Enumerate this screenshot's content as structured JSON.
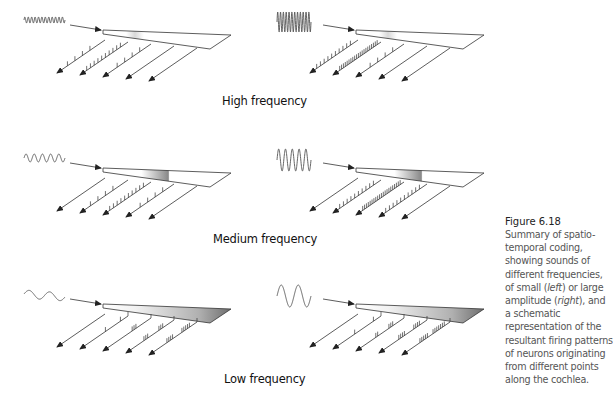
{
  "figure": {
    "number": "Figure 6.18",
    "caption_parts": [
      {
        "text": "Summary of spatio-temporal coding, showing sounds of different frequencies, of small (",
        "italic": false
      },
      {
        "text": "left",
        "italic": true
      },
      {
        "text": ") or large amplitude (",
        "italic": false
      },
      {
        "text": "right",
        "italic": true
      },
      {
        "text": "), and a schematic representation of the resultant firing patterns of neurons originating from different points along the cochlea.",
        "italic": false
      }
    ]
  },
  "rows": [
    {
      "label": "High frequency",
      "label_pos": {
        "x": 222,
        "y": 94
      },
      "y_offset": 0,
      "wave_cycles": 12,
      "shade_start": 0.18,
      "shade_end": 0.32,
      "panels": [
        {
          "side": "left",
          "amplitude": "small",
          "x_offset": 0,
          "amp": 3,
          "spikes": [
            [
              3,
              5,
              7,
              9
            ],
            [
              1,
              2,
              3,
              4,
              5,
              6,
              7,
              8,
              9,
              10
            ],
            [
              2,
              4,
              6,
              8
            ],
            [],
            []
          ]
        },
        {
          "side": "right",
          "amplitude": "large",
          "x_offset": 253,
          "amp": 10,
          "spikes": [
            [
              1,
              2,
              3,
              4,
              5,
              6,
              7,
              8,
              9,
              10
            ],
            [
              0,
              0.5,
              1,
              1.5,
              2,
              2.5,
              3,
              3.5,
              4,
              4.5,
              5,
              5.5,
              6,
              6.5,
              7,
              7.5,
              8,
              8.5,
              9,
              9.5,
              10
            ],
            [
              2,
              4,
              6,
              8
            ],
            [],
            []
          ]
        }
      ]
    },
    {
      "label": "Medium frequency",
      "label_pos": {
        "x": 213,
        "y": 232
      },
      "y_offset": 138,
      "wave_cycles": 5,
      "shade_start": 0.3,
      "shade_end": 0.52,
      "panels": [
        {
          "side": "left",
          "amplitude": "small",
          "x_offset": 0,
          "amp": 4,
          "spikes": [
            [],
            [
              3,
              5,
              7,
              9
            ],
            [
              1,
              2,
              3,
              4,
              5,
              6,
              7,
              8,
              9,
              10
            ],
            [
              2,
              4,
              6,
              8
            ],
            []
          ]
        },
        {
          "side": "right",
          "amplitude": "large",
          "x_offset": 253,
          "amp": 11,
          "spikes": [
            [],
            [
              1,
              2,
              3,
              4,
              5,
              6,
              7,
              8,
              9,
              10
            ],
            [
              0,
              0.5,
              1,
              1.5,
              2,
              2.5,
              3,
              3.5,
              4,
              4.5,
              5,
              5.5,
              6,
              6.5,
              7,
              7.5,
              8,
              8.5,
              9,
              9.5,
              10
            ],
            [
              1,
              2,
              3,
              4,
              5,
              6,
              7,
              8,
              9,
              10
            ],
            []
          ]
        }
      ]
    },
    {
      "label": "Low frequency",
      "label_pos": {
        "x": 224,
        "y": 372
      },
      "y_offset": 274,
      "wave_cycles": 2,
      "shade_start": 0.25,
      "shade_end": 1.0,
      "panels": [
        {
          "side": "left",
          "amplitude": "small",
          "x_offset": 0,
          "amp": 4,
          "spikes": [
            [],
            [
              1,
              5
            ],
            [
              3,
              3.5,
              4
            ],
            [
              2,
              2.5,
              3,
              6,
              6.5,
              7
            ],
            [
              1,
              1.5,
              2,
              2.5,
              3,
              5.5,
              6,
              6.5,
              7
            ]
          ]
        },
        {
          "side": "right",
          "amplitude": "large",
          "x_offset": 253,
          "amp": 11,
          "spikes": [
            [],
            [
              1,
              6
            ],
            [
              2,
              2.5,
              3,
              6,
              6.5
            ],
            [
              1,
              1.5,
              2,
              2.5,
              5,
              5.5,
              6,
              6.5
            ],
            [
              0.5,
              1,
              1.5,
              2,
              2.5,
              3,
              3.5,
              5,
              5.5,
              6,
              6.5,
              7
            ]
          ]
        }
      ]
    }
  ],
  "colors": {
    "line": "#333333",
    "shade": "#8a8a8a",
    "label": "#111111",
    "caption_title": "#222222",
    "caption_body": "#555555"
  }
}
